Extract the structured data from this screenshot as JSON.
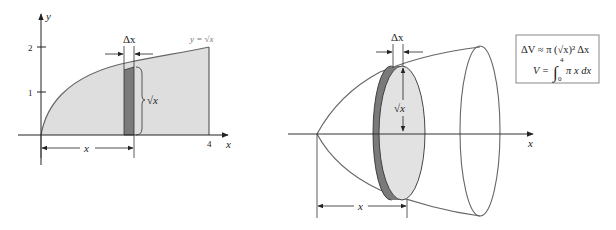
{
  "left_figure": {
    "axis_labels": {
      "x": "x",
      "y": "y"
    },
    "y_ticks": [
      "1",
      "2"
    ],
    "x_ticks": [
      "4"
    ],
    "curve_label": "y = √x",
    "strip_width_label": "Δx",
    "strip_height_label": "√x",
    "distance_label": "x"
  },
  "right_figure": {
    "axis_label": "x",
    "disk_width_label": "Δx",
    "disk_radius_label": "√x",
    "distance_label": "x"
  },
  "formula": {
    "line1": "ΔV ≈ π (√x)² Δx",
    "line2_lhs": "V =",
    "integral_upper": "4",
    "integral_lower": "0",
    "integrand": "π x dx"
  },
  "colors": {
    "region_fill": "#dedede",
    "strip_fill": "#7a7a7a",
    "line": "#555555",
    "axis": "#222222"
  }
}
